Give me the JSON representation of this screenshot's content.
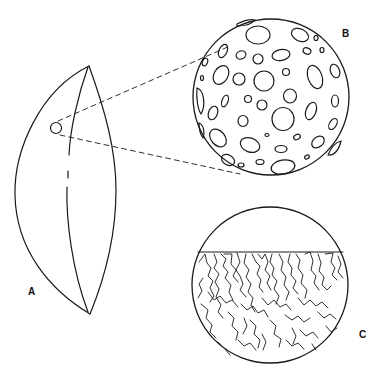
{
  "figure": {
    "labels": {
      "a": "A",
      "b": "B",
      "c": "C"
    },
    "panels": [
      {
        "id": "A",
        "description": "Lens-shaped body (outer view) with small circular sample region marked"
      },
      {
        "id": "B",
        "description": "Magnified circular view of the surface showing numerous oval pits/craters"
      },
      {
        "id": "C",
        "description": "Magnified circular cross-section showing branching channel/crack structures below a flat top surface"
      }
    ],
    "colors": {
      "stroke": "#1a1a1a",
      "background": "#ffffff"
    }
  }
}
